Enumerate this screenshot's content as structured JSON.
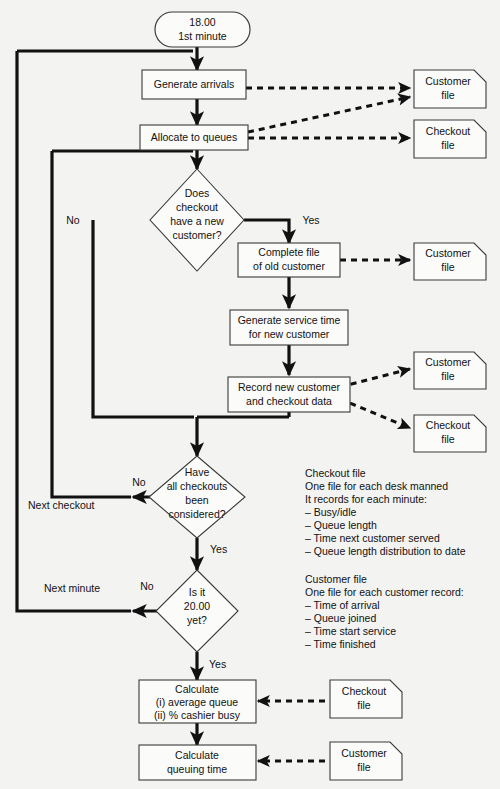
{
  "diagram": {
    "background_color": "#f3f3f2",
    "line_color": "#111111",
    "shape_fill": "#fbfbfa",
    "shape_stroke": "#3a3a3a"
  },
  "nodes": {
    "start": {
      "line1": "18.00",
      "line2": "1st minute"
    },
    "generate_arrivals": {
      "line1": "Generate arrivals"
    },
    "allocate_queues": {
      "line1": "Allocate to queues"
    },
    "decision_new_customer": {
      "line1": "Does",
      "line2": "checkout",
      "line3": "have a new",
      "line4": "customer?"
    },
    "complete_file": {
      "line1": "Complete file",
      "line2": "of old customer"
    },
    "generate_service_time": {
      "line1": "Generate service time",
      "line2": "for new customer"
    },
    "record_new_customer": {
      "line1": "Record new customer",
      "line2": "and checkout data"
    },
    "decision_all_checkouts": {
      "line1": "Have",
      "line2": "all checkouts",
      "line3": "been",
      "line4": "considered?"
    },
    "decision_time": {
      "line1": "Is it",
      "line2": "20.00",
      "line3": "yet?"
    },
    "calculate_queue": {
      "line1": "Calculate",
      "line2": "(i) average queue",
      "line3": "(ii) % cashier busy"
    },
    "calculate_queuing_time": {
      "line1": "Calculate",
      "line2": "queuing time"
    }
  },
  "files": {
    "customer_file_1": {
      "line1": "Customer",
      "line2": "file"
    },
    "checkout_file_1": {
      "line1": "Checkout",
      "line2": "file"
    },
    "customer_file_2": {
      "line1": "Customer",
      "line2": "file"
    },
    "customer_file_3": {
      "line1": "Customer",
      "line2": "file"
    },
    "checkout_file_2": {
      "line1": "Checkout",
      "line2": "file"
    },
    "checkout_file_3": {
      "line1": "Checkout",
      "line2": "file"
    },
    "customer_file_4": {
      "line1": "Customer",
      "line2": "file"
    }
  },
  "edge_labels": {
    "no_new_customer": "No",
    "yes_new_customer": "Yes",
    "no_all_checkouts": "No",
    "yes_all_checkouts": "Yes",
    "no_time": "No",
    "yes_time": "Yes",
    "next_checkout": "Next checkout",
    "next_minute": "Next minute"
  },
  "annotations": {
    "checkout_file_note": [
      "Checkout file",
      "One file for each desk manned",
      "It records for each minute:",
      "– Busy/idle",
      "– Queue length",
      "– Time next customer served",
      "– Queue length distribution to date"
    ],
    "customer_file_note": [
      "Customer file",
      "One file for each customer record:",
      "– Time of arrival",
      "– Queue joined",
      "– Time start service",
      "– Time finished"
    ]
  }
}
